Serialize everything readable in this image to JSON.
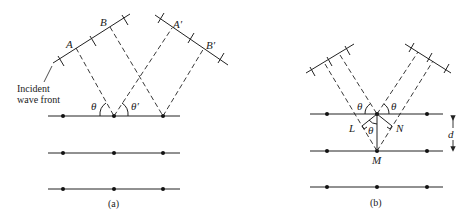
{
  "panel_a": {
    "caption": "(a)",
    "labels": {
      "A": "A",
      "B": "B",
      "A_prime": "A′",
      "B_prime": "B′",
      "theta": "θ",
      "theta_prime": "θ′"
    },
    "incident_label_line1": "Incident",
    "incident_label_line2": "wave front"
  },
  "panel_b": {
    "caption": "(b)",
    "labels": {
      "theta_left": "θ",
      "theta_right": "θ",
      "theta_inner": "θ",
      "L": "L",
      "N": "N",
      "M": "M",
      "d": "d"
    }
  },
  "colors": {
    "ink": "#222222",
    "background": "#ffffff"
  }
}
